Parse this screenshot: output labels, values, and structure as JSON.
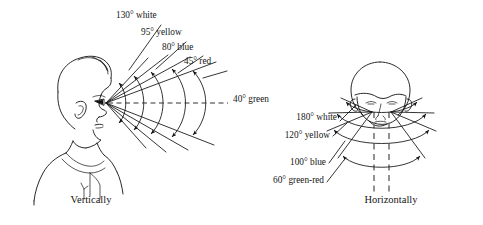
{
  "figure": {
    "background_color": "#ffffff",
    "ink_color": "#111111",
    "panels": [
      {
        "id": "vertical",
        "caption": "Vertically",
        "view": "head-in-profile-facing-right",
        "center_axis_label": "40° green",
        "labels": [
          {
            "text": "130° white",
            "angle_deg": 130,
            "color_name": "white"
          },
          {
            "text": "95° yellow",
            "angle_deg": 95,
            "color_name": "yellow"
          },
          {
            "text": "80° blue",
            "angle_deg": 80,
            "color_name": "blue"
          },
          {
            "text": "45° red",
            "angle_deg": 45,
            "color_name": "red"
          },
          {
            "text": "40° green",
            "angle_deg": 40,
            "color_name": "green"
          }
        ]
      },
      {
        "id": "horizontal",
        "caption": "Horizontally",
        "view": "head-from-above-front",
        "labels": [
          {
            "text": "180° white",
            "angle_deg": 180,
            "color_name": "white"
          },
          {
            "text": "120° yellow",
            "angle_deg": 120,
            "color_name": "yellow"
          },
          {
            "text": "100° blue",
            "angle_deg": 100,
            "color_name": "blue"
          },
          {
            "text": "60° green-red",
            "angle_deg": 60,
            "color_name": "green-red"
          }
        ]
      }
    ]
  }
}
